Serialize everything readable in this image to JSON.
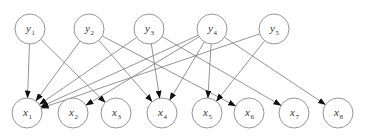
{
  "diagram": {
    "type": "bipartite-directed-graph",
    "colors": {
      "node_stroke": "#8a8a8a",
      "edge": "#7a7a7a",
      "arrow": "#111111",
      "label": "#333333"
    },
    "top_nodes": [
      {
        "id": "y1",
        "base": "y",
        "sub": "1",
        "cx": 30,
        "cy": 29
      },
      {
        "id": "y2",
        "base": "y",
        "sub": "2",
        "cx": 89,
        "cy": 29
      },
      {
        "id": "y3",
        "base": "y",
        "sub": "3",
        "cx": 149,
        "cy": 29
      },
      {
        "id": "y4",
        "base": "y",
        "sub": "4",
        "cx": 212,
        "cy": 29
      },
      {
        "id": "y5",
        "base": "y",
        "sub": "5",
        "cx": 274,
        "cy": 29
      }
    ],
    "bottom_nodes": [
      {
        "id": "x1",
        "base": "x",
        "sub": "1",
        "cx": 27,
        "cy": 113
      },
      {
        "id": "x2",
        "base": "x",
        "sub": "2",
        "cx": 73,
        "cy": 113
      },
      {
        "id": "x3",
        "base": "x",
        "sub": "3",
        "cx": 116,
        "cy": 113
      },
      {
        "id": "x4",
        "base": "x",
        "sub": "4",
        "cx": 162,
        "cy": 113
      },
      {
        "id": "x5",
        "base": "x",
        "sub": "5",
        "cx": 207,
        "cy": 113
      },
      {
        "id": "x6",
        "base": "x",
        "sub": "6",
        "cx": 249,
        "cy": 113
      },
      {
        "id": "x7",
        "base": "x",
        "sub": "7",
        "cx": 294,
        "cy": 113
      },
      {
        "id": "x8",
        "base": "x",
        "sub": "8",
        "cx": 338,
        "cy": 113
      }
    ],
    "radius": 15,
    "edges": [
      [
        "y1",
        "x1"
      ],
      [
        "y1",
        "x3"
      ],
      [
        "y2",
        "x1"
      ],
      [
        "y2",
        "x4"
      ],
      [
        "y2",
        "x6"
      ],
      [
        "y3",
        "x1"
      ],
      [
        "y3",
        "x4"
      ],
      [
        "y3",
        "x7"
      ],
      [
        "y4",
        "x1"
      ],
      [
        "y4",
        "x2"
      ],
      [
        "y4",
        "x4"
      ],
      [
        "y4",
        "x5"
      ],
      [
        "y4",
        "x8"
      ],
      [
        "y5",
        "x1"
      ],
      [
        "y5",
        "x5"
      ]
    ]
  }
}
